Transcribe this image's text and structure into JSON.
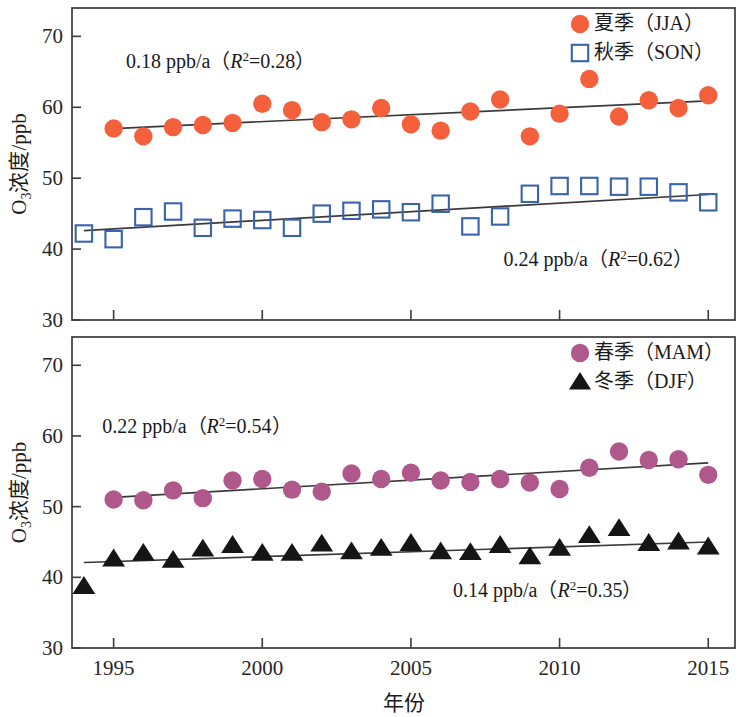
{
  "figure": {
    "width": 753,
    "height": 717,
    "background": "#ffffff",
    "x_axis_title": "年份",
    "y_axis_title_main": "O",
    "y_axis_title_sub": "3",
    "y_axis_title_rest": "浓度/ppb",
    "x_tick_labels": [
      "1995",
      "2000",
      "2005",
      "2010",
      "2015"
    ],
    "x_tick_values": [
      1995,
      2000,
      2005,
      2010,
      2015
    ],
    "y_tick_labels": [
      "30",
      "40",
      "50",
      "60",
      "70"
    ],
    "y_tick_values": [
      30,
      40,
      50,
      60,
      70
    ],
    "xlim": [
      1993.6,
      2015.9
    ],
    "ylim": [
      30,
      74
    ],
    "colors": {
      "summer_marker": "#f4603c",
      "autumn_marker": "#3b62ac",
      "spring_marker": "#b0578b",
      "winter_marker": "#151515",
      "trend_line": "#3a3a3a",
      "frame": "#3b3b3b",
      "text": "#1a1a1a"
    }
  },
  "chart_data": [
    {
      "type": "scatter",
      "panel": "top",
      "title": "",
      "xlabel": "年份",
      "ylabel": "O3浓度/ppb",
      "xlim": [
        1993.6,
        2015.9
      ],
      "ylim": [
        30,
        74
      ],
      "grid": false,
      "legend_position": "top-right",
      "legend": [
        "夏季（JJA）",
        "秋季（SON）"
      ],
      "annotations": [
        {
          "text_prefix": "0.18 ppb/a（",
          "text_r": "R",
          "text_sup": "2",
          "text_suffix": "=0.28）",
          "x": 1998.6,
          "y": 65.6
        },
        {
          "text_prefix": "0.24 ppb/a（",
          "text_r": "R",
          "text_sup": "2",
          "text_suffix": "=0.62）",
          "x": 2011.3,
          "y": 37.6
        }
      ],
      "series": [
        {
          "name": "夏季（JJA）",
          "marker": "circle-filled",
          "color": "#f4603c",
          "x": [
            1995,
            1996,
            1997,
            1998,
            1999,
            2000,
            2001,
            2002,
            2003,
            2004,
            2005,
            2006,
            2007,
            2008,
            2009,
            2010,
            2011,
            2012,
            2013,
            2014,
            2015
          ],
          "values": [
            57.0,
            55.9,
            57.2,
            57.5,
            57.8,
            60.5,
            59.6,
            57.9,
            58.3,
            59.9,
            57.6,
            56.7,
            59.4,
            61.1,
            55.9,
            59.1,
            64.0,
            58.7,
            61.0,
            59.9,
            61.7
          ],
          "trend": {
            "slope": 0.18,
            "r2": 0.28,
            "x1": 1995,
            "y1": 57.0,
            "x2": 2015,
            "y2": 60.9
          }
        },
        {
          "name": "秋季（SON）",
          "marker": "square-open",
          "color": "#3b62ac",
          "x": [
            1994,
            1995,
            1996,
            1997,
            1998,
            1999,
            2000,
            2001,
            2002,
            2003,
            2004,
            2005,
            2006,
            2007,
            2008,
            2009,
            2010,
            2011,
            2012,
            2013,
            2014,
            2015
          ],
          "values": [
            42.2,
            41.4,
            44.5,
            45.3,
            43.0,
            44.3,
            44.1,
            43.0,
            45.0,
            45.4,
            45.6,
            45.2,
            46.4,
            43.2,
            44.6,
            47.8,
            48.9,
            48.9,
            48.8,
            48.8,
            48.0,
            46.6
          ],
          "trend": {
            "slope": 0.24,
            "r2": 0.62,
            "x1": 1994,
            "y1": 42.6,
            "x2": 2015,
            "y2": 47.7
          }
        }
      ]
    },
    {
      "type": "scatter",
      "panel": "bottom",
      "title": "",
      "xlabel": "年份",
      "ylabel": "O3浓度/ppb",
      "xlim": [
        1993.6,
        2015.9
      ],
      "ylim": [
        30,
        74
      ],
      "grid": false,
      "legend_position": "top-right",
      "legend": [
        "春季（MAM）",
        "冬季（DJF）"
      ],
      "annotations": [
        {
          "text_prefix": "0.22 ppb/a（",
          "text_r": "R",
          "text_sup": "2",
          "text_suffix": "=0.54）",
          "x": 1997.8,
          "y": 60.4
        },
        {
          "text_prefix": "0.14 ppb/a（",
          "text_r": "R",
          "text_sup": "2",
          "text_suffix": "=0.35）",
          "x": 2009.6,
          "y": 37.2
        }
      ],
      "series": [
        {
          "name": "春季（MAM）",
          "marker": "circle-filled",
          "color": "#b0578b",
          "x": [
            1995,
            1996,
            1997,
            1998,
            1999,
            2000,
            2001,
            2002,
            2003,
            2004,
            2005,
            2006,
            2007,
            2008,
            2009,
            2010,
            2011,
            2012,
            2013,
            2014,
            2015
          ],
          "values": [
            51.0,
            50.9,
            52.3,
            51.2,
            53.7,
            53.9,
            52.4,
            52.1,
            54.7,
            53.9,
            54.8,
            53.7,
            53.5,
            53.9,
            53.4,
            52.5,
            55.5,
            57.8,
            56.6,
            56.7,
            54.5
          ],
          "trend": {
            "slope": 0.22,
            "r2": 0.54,
            "x1": 1995,
            "y1": 51.3,
            "x2": 2015,
            "y2": 56.2
          }
        },
        {
          "name": "冬季（DJF）",
          "marker": "triangle-filled",
          "color": "#151515",
          "x": [
            1994,
            1995,
            1996,
            1997,
            1998,
            1999,
            2000,
            2001,
            2002,
            2003,
            2004,
            2005,
            2006,
            2007,
            2008,
            2009,
            2010,
            2011,
            2012,
            2013,
            2014,
            2015
          ],
          "values": [
            38.7,
            42.6,
            43.4,
            42.4,
            44.0,
            44.5,
            43.4,
            43.4,
            44.7,
            43.6,
            44.1,
            44.8,
            43.6,
            43.5,
            44.5,
            42.9,
            44.1,
            45.9,
            46.9,
            44.8,
            45.0,
            44.3
          ],
          "trend": {
            "slope": 0.14,
            "r2": 0.35,
            "x1": 1994,
            "y1": 42.1,
            "x2": 2015,
            "y2": 45.0
          }
        }
      ]
    }
  ]
}
